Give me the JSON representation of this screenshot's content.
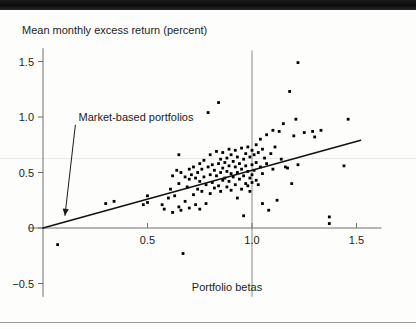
{
  "figure": {
    "name": "scatter-plot-portfolio-betas",
    "background": "#fdfdfc",
    "point_color": "#000000",
    "line_color": "#111111",
    "axis_color": "#6f6f6f"
  },
  "chart_data": {
    "type": "scatter",
    "title": "",
    "xlabel": "Portfolio betas",
    "ylabel": "Mean monthly excess return (percent)",
    "xlim": [
      -0.07,
      1.62
    ],
    "ylim": [
      -0.62,
      1.65
    ],
    "grid": false,
    "legend": null,
    "xticks": [
      0.5,
      1.0,
      1.5
    ],
    "xticklabels": [
      "0.5",
      "1.0",
      "1.5"
    ],
    "yticks": [
      -0.5,
      0,
      0.5,
      1.0,
      1.5
    ],
    "yticklabels": [
      "-0.5",
      "0",
      "0.5",
      "1.0",
      "1.5"
    ],
    "annotations": [
      {
        "text": "Market-based portfolios",
        "text_x": 0.17,
        "text_y": 1.0,
        "arrow_from_x": 0.155,
        "arrow_from_y": 0.93,
        "arrow_to_x": 0.105,
        "arrow_to_y": 0.11
      }
    ],
    "reference_lines": [
      {
        "orientation": "vertical",
        "value": 1.0,
        "y_from": 1.6,
        "y_to": -0.62
      }
    ],
    "fit_line": {
      "label": "Security market line (fitted)",
      "x0": 0.0,
      "y0": 0.0,
      "x1": 1.52,
      "y1": 0.79,
      "slope": 0.52,
      "intercept": 0.0
    },
    "points": [
      [
        0.07,
        -0.15
      ],
      [
        0.3,
        0.22
      ],
      [
        0.34,
        0.24
      ],
      [
        0.48,
        0.21
      ],
      [
        0.5,
        0.29
      ],
      [
        0.5,
        0.23
      ],
      [
        0.57,
        0.21
      ],
      [
        0.58,
        0.17
      ],
      [
        0.6,
        0.27
      ],
      [
        0.61,
        0.35
      ],
      [
        0.62,
        0.47
      ],
      [
        0.62,
        0.14
      ],
      [
        0.63,
        0.29
      ],
      [
        0.64,
        0.52
      ],
      [
        0.65,
        0.66
      ],
      [
        0.65,
        0.4
      ],
      [
        0.65,
        0.19
      ],
      [
        0.66,
        0.5
      ],
      [
        0.66,
        0.16
      ],
      [
        0.67,
        -0.23
      ],
      [
        0.68,
        0.46
      ],
      [
        0.68,
        0.24
      ],
      [
        0.69,
        0.37
      ],
      [
        0.7,
        0.53
      ],
      [
        0.7,
        0.44
      ],
      [
        0.7,
        0.18
      ],
      [
        0.71,
        0.48
      ],
      [
        0.72,
        0.55
      ],
      [
        0.72,
        0.3
      ],
      [
        0.73,
        0.45
      ],
      [
        0.73,
        0.21
      ],
      [
        0.74,
        0.5
      ],
      [
        0.74,
        0.35
      ],
      [
        0.75,
        0.58
      ],
      [
        0.75,
        0.42
      ],
      [
        0.75,
        0.17
      ],
      [
        0.76,
        0.53
      ],
      [
        0.76,
        0.33
      ],
      [
        0.77,
        0.61
      ],
      [
        0.77,
        0.46
      ],
      [
        0.78,
        0.39
      ],
      [
        0.78,
        0.22
      ],
      [
        0.79,
        1.04
      ],
      [
        0.79,
        0.55
      ],
      [
        0.8,
        0.66
      ],
      [
        0.8,
        0.48
      ],
      [
        0.8,
        0.31
      ],
      [
        0.81,
        0.57
      ],
      [
        0.81,
        0.41
      ],
      [
        0.82,
        0.52
      ],
      [
        0.82,
        0.36
      ],
      [
        0.83,
        0.69
      ],
      [
        0.83,
        0.47
      ],
      [
        0.84,
        1.13
      ],
      [
        0.84,
        0.58
      ],
      [
        0.84,
        0.38
      ],
      [
        0.85,
        0.62
      ],
      [
        0.85,
        0.5
      ],
      [
        0.85,
        0.33
      ],
      [
        0.86,
        0.68
      ],
      [
        0.86,
        0.54
      ],
      [
        0.86,
        0.43
      ],
      [
        0.87,
        0.59
      ],
      [
        0.87,
        0.45
      ],
      [
        0.88,
        0.63
      ],
      [
        0.88,
        0.51
      ],
      [
        0.88,
        0.37
      ],
      [
        0.89,
        0.71
      ],
      [
        0.89,
        0.56
      ],
      [
        0.89,
        0.42
      ],
      [
        0.9,
        0.66
      ],
      [
        0.9,
        0.49
      ],
      [
        0.9,
        0.34
      ],
      [
        0.91,
        0.6
      ],
      [
        0.91,
        0.46
      ],
      [
        0.92,
        0.7
      ],
      [
        0.92,
        0.55
      ],
      [
        0.92,
        0.39
      ],
      [
        0.93,
        0.64
      ],
      [
        0.93,
        0.5
      ],
      [
        0.93,
        0.27
      ],
      [
        0.94,
        0.58
      ],
      [
        0.94,
        0.44
      ],
      [
        0.95,
        0.72
      ],
      [
        0.95,
        0.53
      ],
      [
        0.95,
        0.35
      ],
      [
        0.96,
        0.62
      ],
      [
        0.96,
        0.47
      ],
      [
        0.96,
        0.11
      ],
      [
        0.97,
        0.67
      ],
      [
        0.97,
        0.56
      ],
      [
        0.97,
        0.4
      ],
      [
        0.98,
        0.73
      ],
      [
        0.98,
        0.51
      ],
      [
        0.98,
        0.38
      ],
      [
        0.99,
        0.64
      ],
      [
        0.99,
        0.45
      ],
      [
        0.99,
        0.33
      ],
      [
        1.0,
        0.7
      ],
      [
        1.0,
        0.57
      ],
      [
        1.0,
        0.48
      ],
      [
        1.0,
        0.41
      ],
      [
        1.01,
        0.66
      ],
      [
        1.01,
        0.52
      ],
      [
        1.02,
        0.75
      ],
      [
        1.02,
        0.59
      ],
      [
        1.02,
        0.43
      ],
      [
        1.03,
        0.68
      ],
      [
        1.03,
        0.39
      ],
      [
        1.04,
        0.8
      ],
      [
        1.04,
        0.55
      ],
      [
        1.05,
        0.71
      ],
      [
        1.05,
        0.49
      ],
      [
        1.05,
        0.22
      ],
      [
        1.06,
        0.63
      ],
      [
        1.07,
        0.84
      ],
      [
        1.07,
        0.58
      ],
      [
        1.08,
        0.16
      ],
      [
        1.09,
        0.67
      ],
      [
        1.1,
        0.88
      ],
      [
        1.1,
        0.53
      ],
      [
        1.11,
        0.73
      ],
      [
        1.12,
        0.25
      ],
      [
        1.13,
        0.87
      ],
      [
        1.14,
        0.62
      ],
      [
        1.15,
        0.94
      ],
      [
        1.16,
        0.55
      ],
      [
        1.17,
        0.54
      ],
      [
        1.18,
        1.23
      ],
      [
        1.19,
        0.4
      ],
      [
        1.2,
        0.83
      ],
      [
        1.21,
        0.98
      ],
      [
        1.22,
        1.49
      ],
      [
        1.22,
        0.57
      ],
      [
        1.25,
        0.86
      ],
      [
        1.29,
        0.87
      ],
      [
        1.3,
        0.82
      ],
      [
        1.33,
        0.88
      ],
      [
        1.37,
        0.1
      ],
      [
        1.37,
        0.04
      ],
      [
        1.44,
        0.56
      ],
      [
        1.46,
        0.98
      ]
    ]
  }
}
